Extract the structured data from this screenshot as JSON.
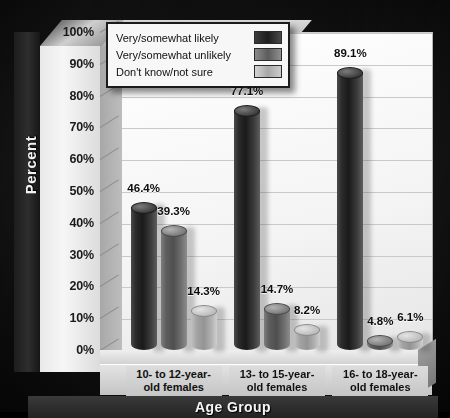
{
  "chart_data": {
    "type": "bar",
    "title": "",
    "xlabel": "Age Group",
    "ylabel": "Percent",
    "ylim": [
      0,
      100
    ],
    "ytick_labels": [
      "100%",
      "90%",
      "80%",
      "70%",
      "60%",
      "50%",
      "40%",
      "30%",
      "20%",
      "10%",
      "0%"
    ],
    "ytick_values": [
      100,
      90,
      80,
      70,
      60,
      50,
      40,
      30,
      20,
      10,
      0
    ],
    "grid": true,
    "legend_position": "top-left",
    "categories": [
      "10- to 12-year-old females",
      "13- to 15-year-old females",
      "16- to 18-year-old females"
    ],
    "category_lines": [
      [
        "10- to 12-year-",
        "old females"
      ],
      [
        "13- to 15-year-",
        "old females"
      ],
      [
        "16- to 18-year-",
        "old females"
      ]
    ],
    "series": [
      {
        "name": "Very/somewhat likely",
        "color": "#1d1d1d",
        "values": [
          46.4,
          77.1,
          89.1
        ],
        "labels": [
          "46.4%",
          "77.1%",
          "89.1%"
        ]
      },
      {
        "name": "Very/somewhat unlikely",
        "color": "#5c5c5c",
        "values": [
          39.3,
          14.7,
          4.8
        ],
        "labels": [
          "39.3%",
          "14.7%",
          "4.8%"
        ]
      },
      {
        "name": "Don't know/not sure",
        "color": "#a6a6a6",
        "values": [
          14.3,
          8.2,
          6.1
        ],
        "labels": [
          "14.3%",
          "8.2%",
          "6.1%"
        ]
      }
    ]
  },
  "legend": {
    "items": [
      {
        "label": "Very/somewhat likely"
      },
      {
        "label": "Very/somewhat unlikely"
      },
      {
        "label": "Don't know/not sure"
      }
    ]
  },
  "axes": {
    "y_title": "Percent",
    "x_title": "Age Group"
  }
}
